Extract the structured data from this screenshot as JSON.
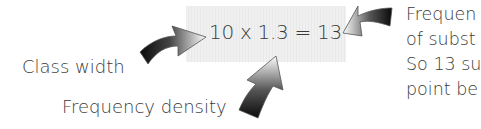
{
  "equation": {
    "text": "10 x 1.3 = 13",
    "class_width": "10",
    "frequency_density": "1.3",
    "frequency": "13"
  },
  "labels": {
    "class_width": "Class width",
    "frequency_density": "Frequency density"
  },
  "note": {
    "lines": [
      "Frequen",
      "of subst",
      "So 13 su",
      "point be"
    ]
  },
  "colors": {
    "text": "#3a3a3a",
    "highlight": "#eeeeee",
    "arrow_dark": "#111111",
    "arrow_light": "#ffffff"
  }
}
